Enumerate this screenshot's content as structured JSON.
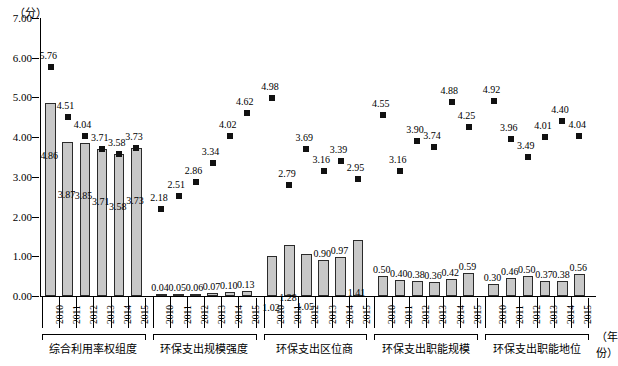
{
  "axis": {
    "y_unit": "（分）",
    "x_unit": "（年份）",
    "y_ticks": [
      "0.00",
      "1.00",
      "2.00",
      "3.00",
      "4.00",
      "5.00",
      "6.00",
      "7.00"
    ]
  },
  "chart_data": {
    "type": "bar",
    "title": "",
    "xlabel": "（年份）",
    "ylabel": "（分）",
    "ylim": [
      0,
      7
    ],
    "grid": false,
    "legend": "none",
    "categories": [
      "2010",
      "2011",
      "2012",
      "2013",
      "2014",
      "2015"
    ],
    "groups": [
      {
        "name": "综合利用率权组度",
        "years": [
          "2010",
          "2011",
          "2012",
          "2013",
          "2014",
          "2015"
        ],
        "bar_values": [
          4.86,
          3.87,
          3.85,
          3.71,
          3.58,
          3.73
        ],
        "bar_labels": [
          "4.86",
          "3.87",
          "3.85",
          "3.71",
          "3.58",
          "3.73"
        ],
        "marker_values": [
          5.76,
          4.51,
          4.04,
          3.71,
          3.58,
          3.73
        ],
        "marker_labels": [
          "5.76",
          "4.51",
          "4.04",
          "3.71",
          "3.58",
          "3.73"
        ]
      },
      {
        "name": "环保支出规模强度",
        "years": [
          "2010",
          "2011",
          "2012",
          "2013",
          "2014",
          "2015"
        ],
        "bar_values": [
          0.04,
          0.05,
          0.06,
          0.07,
          0.1,
          0.13
        ],
        "bar_labels": [
          "0.04",
          "0.05",
          "0.06",
          "0.07",
          "0.10",
          "0.13"
        ],
        "marker_values": [
          2.18,
          2.51,
          2.86,
          3.34,
          4.02,
          4.62
        ],
        "marker_labels": [
          "2.18",
          "2.51",
          "2.86",
          "3.34",
          "4.02",
          "4.62"
        ]
      },
      {
        "name": "环保支出区位商",
        "years": [
          "2010",
          "2011",
          "2012",
          "2013",
          "2014",
          "2015"
        ],
        "bar_values": [
          1.02,
          1.28,
          1.05,
          0.9,
          0.97,
          1.41
        ],
        "bar_labels": [
          "1.02",
          "1.28",
          "1.05",
          "0.90",
          "0.97",
          "1.41"
        ],
        "marker_values": [
          4.98,
          2.79,
          3.69,
          3.16,
          3.39,
          2.95
        ],
        "marker_labels": [
          "4.98",
          "2.79",
          "3.69",
          "3.16",
          "3.39",
          "2.95"
        ]
      },
      {
        "name": "环保支出职能规模",
        "years": [
          "2010",
          "2011",
          "2012",
          "2013",
          "2014",
          "2015"
        ],
        "bar_values": [
          0.5,
          0.4,
          0.38,
          0.36,
          0.42,
          0.59
        ],
        "bar_labels": [
          "0.50",
          "0.40",
          "0.38",
          "0.36",
          "0.42",
          "0.59"
        ],
        "marker_values": [
          4.55,
          3.16,
          3.9,
          3.74,
          4.88,
          4.25
        ],
        "marker_labels": [
          "4.55",
          "3.16",
          "3.90",
          "3.74",
          "4.88",
          "4.25"
        ]
      },
      {
        "name": "环保支出职能地位",
        "years": [
          "2010",
          "2011",
          "2012",
          "2013",
          "2014",
          "2015"
        ],
        "bar_values": [
          0.3,
          0.46,
          0.5,
          0.37,
          0.38,
          0.56
        ],
        "bar_labels": [
          "0.30",
          "0.46",
          "0.50",
          "0.37",
          "0.38",
          "0.56"
        ],
        "marker_values": [
          4.92,
          3.96,
          3.49,
          4.01,
          4.4,
          4.04
        ],
        "marker_labels": [
          "4.92",
          "3.96",
          "3.49",
          "4.01",
          "4.40",
          "4.04"
        ]
      }
    ]
  }
}
